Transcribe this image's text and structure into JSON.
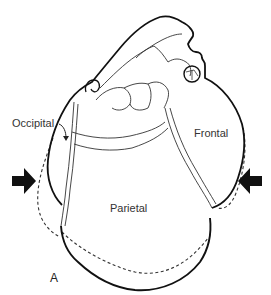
{
  "figure": {
    "panel_letter": "A",
    "labels": {
      "occipital": "Occipital",
      "frontal": "Frontal",
      "parietal": "Parietal"
    },
    "icons": {
      "left_arrow": "arrow-right-icon",
      "right_arrow": "arrow-left-icon"
    },
    "colors": {
      "ink": "#111111",
      "thin_line": "#333333",
      "dashed": "#333333",
      "background": "#ffffff"
    }
  }
}
